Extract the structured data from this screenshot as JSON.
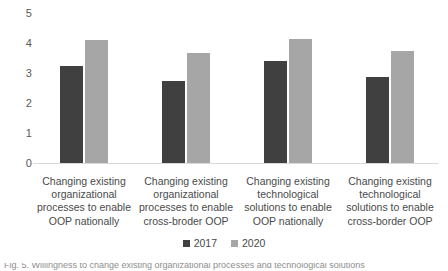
{
  "chart_data": {
    "type": "bar",
    "title": "",
    "xlabel": "",
    "ylabel": "",
    "ylim": [
      0,
      5
    ],
    "yticks": [
      5,
      4,
      3,
      2,
      1,
      0
    ],
    "grid": false,
    "legend_position": "bottom-center",
    "categories": [
      "Changing existing\norganizational\nprocesses to enable\nOOP nationally",
      "Changing existing\norganizational\nprocesses to enable\ncross-broder OOP",
      "Changing existing\ntechnological\nsolutions to enable\nOOP nationally",
      "Changing existing\ntechnological\nsolutions to enable\ncross-border OOP"
    ],
    "series": [
      {
        "name": "2017",
        "color": "#404040",
        "values": [
          3.23,
          2.73,
          3.4,
          2.87
        ]
      },
      {
        "name": "2020",
        "color": "#a6a6a6",
        "values": [
          4.1,
          3.67,
          4.13,
          3.73
        ]
      }
    ]
  },
  "legend": {
    "items": [
      {
        "label": "2017",
        "color": "#404040"
      },
      {
        "label": "2020",
        "color": "#a6a6a6"
      }
    ]
  },
  "caption": {
    "clipped_text": "Fig. 5. Willingness to change existing organizational processes and technological solutions"
  }
}
